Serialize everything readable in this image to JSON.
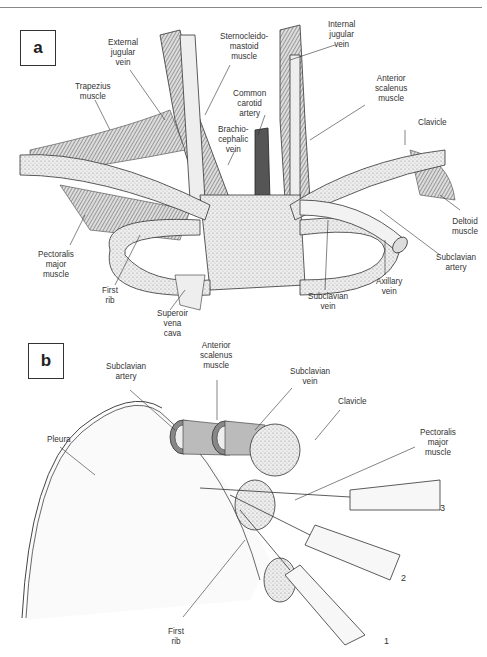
{
  "figure": {
    "panels": [
      {
        "id": "a",
        "label": "a",
        "annotations": [
          {
            "text": "External\njugular\nvein"
          },
          {
            "text": "Sternocleido-\nmastoid\nmuscle"
          },
          {
            "text": "Internal\njugular\nvein"
          },
          {
            "text": "Trapezius\nmuscle"
          },
          {
            "text": "Common\ncarotid\nartery"
          },
          {
            "text": "Anterior\nscalenus\nmuscle"
          },
          {
            "text": "Brachio-\ncephalic\nvein"
          },
          {
            "text": "Clavicle"
          },
          {
            "text": "Deltoid\nmuscle"
          },
          {
            "text": "Pectoralis\nmajor\nmuscle"
          },
          {
            "text": "Subclavian\nartery"
          },
          {
            "text": "Axillary\nvein"
          },
          {
            "text": "First\nrib"
          },
          {
            "text": "Subclavian\nvein"
          },
          {
            "text": "Superoir\nvena\ncava"
          }
        ],
        "clavicle_segments": [
          "Medial",
          "Middle",
          "Lateral"
        ]
      },
      {
        "id": "b",
        "label": "b",
        "annotations": [
          {
            "text": "Subclavian\nartery"
          },
          {
            "text": "Anterior\nscalenus\nmuscle"
          },
          {
            "text": "Subclavian\nvein"
          },
          {
            "text": "Pleura"
          },
          {
            "text": "Clavicle"
          },
          {
            "text": "Pectoralis\nmajor\nmuscle"
          },
          {
            "text": "First\nrib"
          }
        ],
        "needle_numbers": [
          "3",
          "2",
          "1"
        ]
      }
    ]
  }
}
